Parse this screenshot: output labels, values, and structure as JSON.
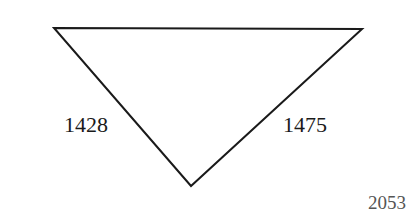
{
  "diagram": {
    "shape": "inverted-triangle",
    "vertices": [
      {
        "name": "top-left",
        "x": 54,
        "y": 28
      },
      {
        "name": "top-right",
        "x": 362,
        "y": 29
      },
      {
        "name": "bottom",
        "x": 191,
        "y": 186
      }
    ],
    "stroke_color": "#1a1a1a",
    "labels": {
      "left_side": "1428",
      "right_side": "1475"
    }
  },
  "page_number": "2053"
}
